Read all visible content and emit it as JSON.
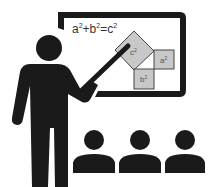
{
  "illustration": {
    "subject": "teacher presenting Pythagorean theorem at whiteboard to students",
    "formula": {
      "a": "a",
      "plus": "+",
      "b": "b",
      "equals": "=",
      "c": "c",
      "exp": "2"
    },
    "squares": {
      "c_label": "c",
      "a_label": "a",
      "b_label": "b",
      "exp": "2"
    },
    "student_count": 3,
    "colors": {
      "figure": "#1a1a1a",
      "board_frame": "#1a1a1a",
      "board_fill": "#ffffff",
      "square_fill": "#c8c8c8",
      "square_stroke": "#444444",
      "text": "#333333"
    }
  }
}
